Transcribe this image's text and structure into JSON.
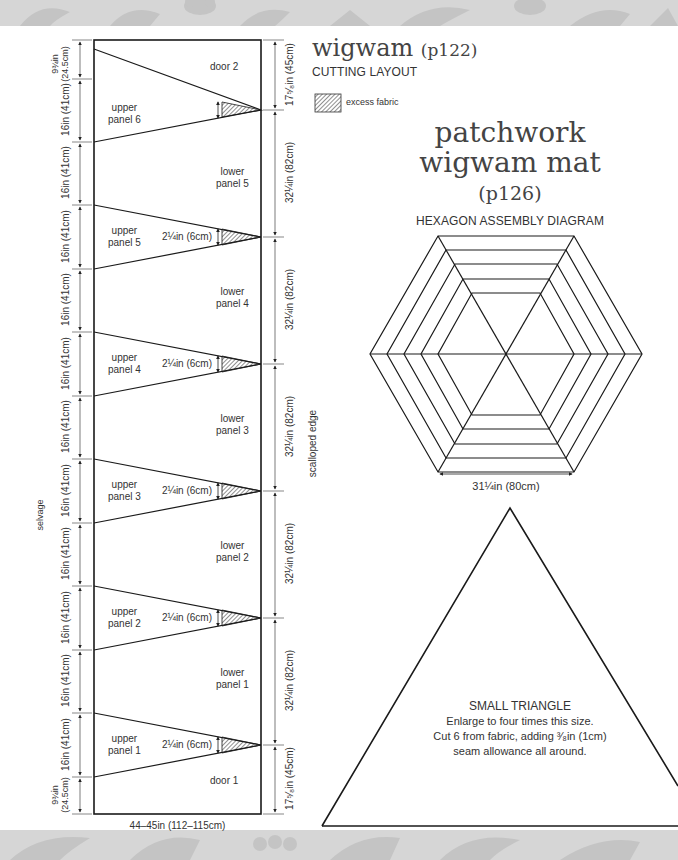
{
  "header": {
    "title_main": "wigwam",
    "title_page": "(p122)",
    "subtitle": "CUTTING LAYOUT",
    "legend": {
      "icon": "hatched-swatch-icon",
      "label": "excess fabric"
    }
  },
  "cutting_layout": {
    "left_edge_label": "selvage",
    "right_edge_label": "scalloped edge",
    "bottom_width": "44–45in (112–115cm)",
    "left_dimensions": [
      "9¾in (24.5cm)",
      "16in (41cm)",
      "16in (41cm)",
      "16in (41cm)",
      "16in (41cm)",
      "16in (41cm)",
      "16in (41cm)",
      "16in (41cm)",
      "16in (41cm)",
      "16in (41cm)",
      "16in (41cm)",
      "16in (41cm)",
      "9¾in (24.5cm)"
    ],
    "left_dim_split": {
      "top": "9¾in",
      "bottom": "(24.5cm)"
    },
    "right_dimensions": [
      "17⁵⁄₈in (45cm)",
      "32¼in (82cm)",
      "32¼in (82cm)",
      "32¼in (82cm)",
      "32¼in (82cm)",
      "32¼in (82cm)",
      "17⁵⁄₈in (45cm)"
    ],
    "pieces": {
      "door_top": "door 2",
      "door_bottom": "door 1",
      "upper_panels": [
        {
          "line1": "upper",
          "line2": "panel 6",
          "excess": ""
        },
        {
          "line1": "upper",
          "line2": "panel 5",
          "excess": "2¼in (6cm)"
        },
        {
          "line1": "upper",
          "line2": "panel 4",
          "excess": "2¼in (6cm)"
        },
        {
          "line1": "upper",
          "line2": "panel 3",
          "excess": "2¼in (6cm)"
        },
        {
          "line1": "upper",
          "line2": "panel 2",
          "excess": "2¼in (6cm)"
        },
        {
          "line1": "upper",
          "line2": "panel 1",
          "excess": "2¼in (6cm)"
        }
      ],
      "lower_panels": [
        {
          "line1": "lower",
          "line2": "panel 5"
        },
        {
          "line1": "lower",
          "line2": "panel 4"
        },
        {
          "line1": "lower",
          "line2": "panel 3"
        },
        {
          "line1": "lower",
          "line2": "panel 2"
        },
        {
          "line1": "lower",
          "line2": "panel 1"
        }
      ]
    }
  },
  "mat": {
    "title_line1": "patchwork",
    "title_line2": "wigwam mat",
    "title_page": "(p126)",
    "hexagon_heading": "HEXAGON ASSEMBLY DIAGRAM",
    "hexagon_width": "31¼in (80cm)",
    "triangle": {
      "heading": "SMALL TRIANGLE",
      "line1": "Enlarge to four times this size.",
      "line2": "Cut 6 from fabric, adding ³⁄₈in (1cm)",
      "line3": "seam allowance all around."
    }
  },
  "colors": {
    "band": "#d6d6d6",
    "band_pattern": "#c2c2c2",
    "line": "#1a1a1a",
    "text": "#333333"
  }
}
